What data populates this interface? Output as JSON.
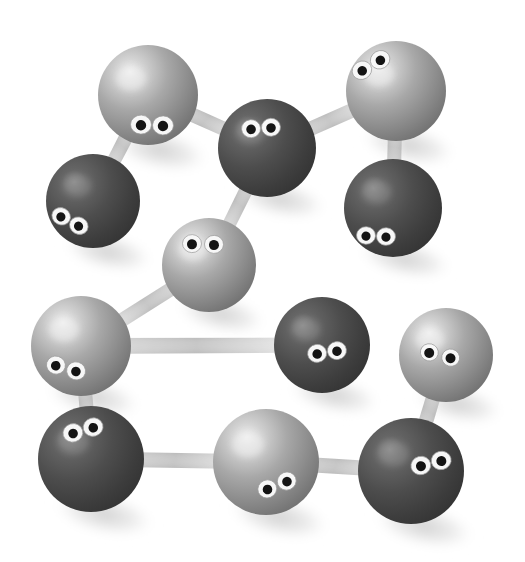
{
  "scene": {
    "title": "Molecular ball-and-stick model with googly eyes",
    "width": 525,
    "height": 562,
    "background_color": "#ffffff",
    "description": "Twelve spheres of two shades of gray, each with a pair of googly eyes, joined by tapered gray bonds and casting soft shadows.",
    "colors": {
      "light_atom_base": "#9a9a9a",
      "light_atom_highlight": "#e8e8e8",
      "light_atom_shadow": "#6f6f6f",
      "dark_atom_base": "#4a4a4a",
      "dark_atom_highlight": "#8d8d8d",
      "dark_atom_shadow": "#2e2e2e",
      "bond_color": "#b4b4b4",
      "bond_fade": "#f2f2f2",
      "eye_white": "#f5f5f5",
      "eye_pupil": "#1a1a1a",
      "shadow_color": "#d8d8d8"
    }
  },
  "chart_data": {
    "type": "scatter",
    "xlabel": "",
    "ylabel": "",
    "xlim": [
      0,
      525
    ],
    "ylim": [
      0,
      562
    ],
    "grid": false,
    "legend": null,
    "series": [
      {
        "name": "light atoms",
        "color": "#9a9a9a",
        "points": [
          {
            "id": "a1",
            "x": 148,
            "y": 95,
            "r": 50
          },
          {
            "id": "a4",
            "x": 396,
            "y": 91,
            "r": 50
          },
          {
            "id": "a6",
            "x": 209,
            "y": 265,
            "r": 47
          },
          {
            "id": "a7",
            "x": 81,
            "y": 346,
            "r": 50
          },
          {
            "id": "a11",
            "x": 266,
            "y": 462,
            "r": 53
          },
          {
            "id": "a10",
            "x": 446,
            "y": 355,
            "r": 47
          }
        ]
      },
      {
        "name": "dark atoms",
        "color": "#4a4a4a",
        "points": [
          {
            "id": "a2",
            "x": 93,
            "y": 201,
            "r": 47
          },
          {
            "id": "a3",
            "x": 267,
            "y": 148,
            "r": 49
          },
          {
            "id": "a5",
            "x": 393,
            "y": 208,
            "r": 49
          },
          {
            "id": "a8",
            "x": 322,
            "y": 345,
            "r": 48
          },
          {
            "id": "a9",
            "x": 91,
            "y": 459,
            "r": 53
          },
          {
            "id": "a12",
            "x": 411,
            "y": 471,
            "r": 53
          }
        ]
      }
    ],
    "bonds": [
      {
        "from": "a1",
        "to": "a2"
      },
      {
        "from": "a1",
        "to": "a3"
      },
      {
        "from": "a3",
        "to": "a4"
      },
      {
        "from": "a4",
        "to": "a5"
      },
      {
        "from": "a3",
        "to": "a6"
      },
      {
        "from": "a6",
        "to": "a7"
      },
      {
        "from": "a7",
        "to": "a8"
      },
      {
        "from": "a7",
        "to": "a9"
      },
      {
        "from": "a9",
        "to": "a11"
      },
      {
        "from": "a10",
        "to": "a12"
      },
      {
        "from": "a11",
        "to": "a12"
      }
    ]
  },
  "atoms": [
    {
      "name": "atom-1",
      "shade": "light",
      "cx": 148,
      "cy": 95,
      "r": 50,
      "eyes": {
        "cx": 152,
        "cy": 125,
        "angle": 2,
        "gap": 22,
        "rx": 10.5,
        "ry": 9.5,
        "pupil": 5.2
      }
    },
    {
      "name": "atom-2",
      "shade": "dark",
      "cx": 93,
      "cy": 201,
      "r": 47,
      "eyes": {
        "cx": 70,
        "cy": 221,
        "angle": 28,
        "gap": 20,
        "rx": 9.5,
        "ry": 8.5,
        "pupil": 4.6
      }
    },
    {
      "name": "atom-3",
      "shade": "dark",
      "cx": 267,
      "cy": 148,
      "r": 49,
      "eyes": {
        "cx": 261,
        "cy": 128,
        "angle": -4,
        "gap": 20,
        "rx": 9.5,
        "ry": 9.0,
        "pupil": 4.8
      }
    },
    {
      "name": "atom-4",
      "shade": "light",
      "cx": 396,
      "cy": 91,
      "r": 50,
      "eyes": {
        "cx": 371,
        "cy": 65,
        "angle": -30,
        "gap": 21,
        "rx": 10.0,
        "ry": 9.0,
        "pupil": 4.8
      }
    },
    {
      "name": "atom-5",
      "shade": "dark",
      "cx": 393,
      "cy": 208,
      "r": 49,
      "eyes": {
        "cx": 376,
        "cy": 236,
        "angle": 3,
        "gap": 20,
        "rx": 9.5,
        "ry": 8.8,
        "pupil": 4.6
      }
    },
    {
      "name": "atom-6",
      "shade": "light",
      "cx": 209,
      "cy": 265,
      "r": 47,
      "eyes": {
        "cx": 203,
        "cy": 244,
        "angle": 2,
        "gap": 22,
        "rx": 9.5,
        "ry": 9.0,
        "pupil": 5.0
      }
    },
    {
      "name": "atom-7",
      "shade": "light",
      "cx": 81,
      "cy": 346,
      "r": 50,
      "eyes": {
        "cx": 66,
        "cy": 368,
        "angle": 16,
        "gap": 21,
        "rx": 9.5,
        "ry": 9.0,
        "pupil": 4.8
      }
    },
    {
      "name": "atom-8",
      "shade": "dark",
      "cx": 322,
      "cy": 345,
      "r": 48,
      "eyes": {
        "cx": 327,
        "cy": 352,
        "angle": -8,
        "gap": 20,
        "rx": 9.5,
        "ry": 9.0,
        "pupil": 4.8
      }
    },
    {
      "name": "atom-9",
      "shade": "dark",
      "cx": 91,
      "cy": 459,
      "r": 53,
      "eyes": {
        "cx": 83,
        "cy": 430,
        "angle": -16,
        "gap": 21,
        "rx": 10.0,
        "ry": 9.2,
        "pupil": 4.8
      }
    },
    {
      "name": "atom-10",
      "shade": "light",
      "cx": 446,
      "cy": 355,
      "r": 47,
      "eyes": {
        "cx": 440,
        "cy": 355,
        "angle": 14,
        "gap": 22,
        "rx": 9.0,
        "ry": 8.6,
        "pupil": 5.0
      }
    },
    {
      "name": "atom-11",
      "shade": "light",
      "cx": 266,
      "cy": 462,
      "r": 53,
      "eyes": {
        "cx": 277,
        "cy": 485,
        "angle": -22,
        "gap": 21,
        "rx": 9.5,
        "ry": 9.0,
        "pupil": 4.8
      }
    },
    {
      "name": "atom-12",
      "shade": "dark",
      "cx": 411,
      "cy": 471,
      "r": 53,
      "eyes": {
        "cx": 431,
        "cy": 463,
        "angle": -14,
        "gap": 21,
        "rx": 10.0,
        "ry": 9.2,
        "pupil": 5.0
      }
    }
  ],
  "bonds": [
    {
      "name": "bond-1-2",
      "x1": 148,
      "y1": 95,
      "x2": 93,
      "y2": 201,
      "w1": 15,
      "w2": 13
    },
    {
      "name": "bond-1-3",
      "x1": 148,
      "y1": 95,
      "x2": 267,
      "y2": 148,
      "w1": 15,
      "w2": 14
    },
    {
      "name": "bond-3-4",
      "x1": 267,
      "y1": 148,
      "x2": 396,
      "y2": 91,
      "w1": 14,
      "w2": 15
    },
    {
      "name": "bond-4-5",
      "x1": 396,
      "y1": 91,
      "x2": 393,
      "y2": 208,
      "w1": 14,
      "w2": 14
    },
    {
      "name": "bond-3-6",
      "x1": 267,
      "y1": 148,
      "x2": 209,
      "y2": 265,
      "w1": 14,
      "w2": 13
    },
    {
      "name": "bond-6-7",
      "x1": 209,
      "y1": 265,
      "x2": 81,
      "y2": 346,
      "w1": 14,
      "w2": 14
    },
    {
      "name": "bond-7-8",
      "x1": 81,
      "y1": 346,
      "x2": 322,
      "y2": 345,
      "w1": 16,
      "w2": 15
    },
    {
      "name": "bond-7-9",
      "x1": 81,
      "y1": 346,
      "x2": 91,
      "y2": 459,
      "w1": 14,
      "w2": 14
    },
    {
      "name": "bond-9-11",
      "x1": 91,
      "y1": 459,
      "x2": 266,
      "y2": 462,
      "w1": 15,
      "w2": 15
    },
    {
      "name": "bond-10-12",
      "x1": 446,
      "y1": 355,
      "x2": 411,
      "y2": 471,
      "w1": 14,
      "w2": 15
    },
    {
      "name": "bond-11-12",
      "x1": 266,
      "y1": 462,
      "x2": 411,
      "y2": 471,
      "w1": 15,
      "w2": 15
    }
  ],
  "shadows": [
    {
      "name": "shadow-1",
      "cx": 160,
      "cy": 150,
      "rx": 52,
      "ry": 22,
      "a": 12
    },
    {
      "name": "shadow-2",
      "cx": 108,
      "cy": 252,
      "rx": 48,
      "ry": 20,
      "a": 12
    },
    {
      "name": "shadow-3",
      "cx": 280,
      "cy": 199,
      "rx": 50,
      "ry": 20,
      "a": 12
    },
    {
      "name": "shadow-4",
      "cx": 408,
      "cy": 145,
      "rx": 51,
      "ry": 21,
      "a": 12
    },
    {
      "name": "shadow-5",
      "cx": 405,
      "cy": 259,
      "rx": 50,
      "ry": 20,
      "a": 12
    },
    {
      "name": "shadow-6",
      "cx": 221,
      "cy": 314,
      "rx": 48,
      "ry": 20,
      "a": 12
    },
    {
      "name": "shadow-7",
      "cx": 93,
      "cy": 397,
      "rx": 51,
      "ry": 21,
      "a": 12
    },
    {
      "name": "shadow-8",
      "cx": 334,
      "cy": 395,
      "rx": 49,
      "ry": 20,
      "a": 12
    },
    {
      "name": "shadow-9",
      "cx": 104,
      "cy": 514,
      "rx": 54,
      "ry": 22,
      "a": 12
    },
    {
      "name": "shadow-10",
      "cx": 458,
      "cy": 404,
      "rx": 48,
      "ry": 20,
      "a": 12
    },
    {
      "name": "shadow-11",
      "cx": 279,
      "cy": 517,
      "rx": 54,
      "ry": 22,
      "a": 12
    },
    {
      "name": "shadow-12",
      "cx": 424,
      "cy": 526,
      "rx": 54,
      "ry": 22,
      "a": 12
    }
  ]
}
